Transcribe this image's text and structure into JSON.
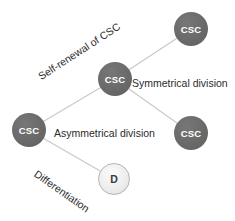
{
  "diagram": {
    "nodes": [
      {
        "id": "csc-left",
        "label": "CSC",
        "type": "stem"
      },
      {
        "id": "csc-middle",
        "label": "CSC",
        "type": "stem"
      },
      {
        "id": "csc-top-right",
        "label": "CSC",
        "type": "stem"
      },
      {
        "id": "csc-bottom-right",
        "label": "CSC",
        "type": "stem"
      },
      {
        "id": "differentiated",
        "label": "D",
        "type": "differentiated"
      }
    ],
    "labels": {
      "self_renewal": "Self-renewal of CSC",
      "symmetrical": "Symmetrical division",
      "asymmetrical": "Asymmetrical division",
      "differentiation": "Differentiation"
    },
    "edges": [
      {
        "from": "csc-left",
        "to": "csc-middle"
      },
      {
        "from": "csc-middle",
        "to": "csc-top-right"
      },
      {
        "from": "csc-middle",
        "to": "csc-bottom-right"
      },
      {
        "from": "csc-left",
        "to": "differentiated"
      }
    ],
    "colors": {
      "stem_fill": "#6a6a6a",
      "stem_text": "#ffffff",
      "diff_fill": "#ededed",
      "diff_border": "#b3b3b3",
      "diff_text": "#3a3a3a",
      "edge_line": "#c9c9c9",
      "label_text": "#2b2b2b",
      "background": "#ffffff"
    }
  }
}
